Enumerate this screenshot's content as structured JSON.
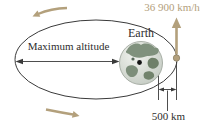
{
  "labels": {
    "earth": "Earth",
    "maximum_altitude": "Maximum altitude",
    "speed": "36 900 km/h",
    "perigee_altitude": "500 km"
  },
  "colors": {
    "accent_tan": "#b3a07c",
    "line_dark": "#3a3a3a",
    "text_dark": "#2e2e2e",
    "globe_ocean": "#d7dbd4",
    "globe_land": "#80917d"
  },
  "icons": {
    "earth_globe": "earth-globe",
    "satellite": "satellite-dot",
    "velocity_arrow": "up-arrow",
    "orbit_direction_top": "curved-left-arrow",
    "orbit_direction_bottom": "curved-right-arrow"
  }
}
